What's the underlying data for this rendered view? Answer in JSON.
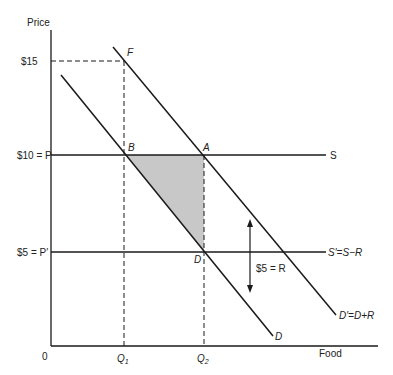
{
  "diagram": {
    "axes": {
      "y_label": "Price",
      "x_label": "Food",
      "origin_label": "0"
    },
    "price_labels": {
      "p15": "$15",
      "p10": "$10 = P",
      "p5": "$5 = P′"
    },
    "quantity_labels": {
      "q1": "Q",
      "q1_sub": "1",
      "q2": "Q",
      "q2_sub": "2"
    },
    "points": {
      "F": "F",
      "B": "B",
      "A": "A",
      "D": "D"
    },
    "curves": {
      "supply": "S",
      "supply_shifted": "S′=S−R",
      "demand": "D",
      "demand_shifted": "D′=D+R"
    },
    "annotation": {
      "subsidy": "$5 = R"
    },
    "colors": {
      "shaded_area": "#c8c8c8",
      "line": "#1a1a1a"
    }
  }
}
